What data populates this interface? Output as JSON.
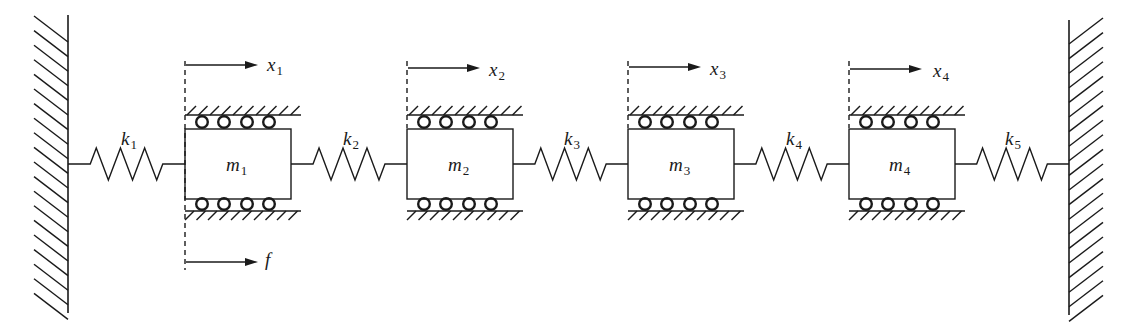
{
  "diagram": {
    "line_color": "#1a1a1a",
    "background": "#ffffff",
    "masses": [
      {
        "label": "m",
        "sub": "1",
        "displacement": "x",
        "disp_sub": "1"
      },
      {
        "label": "m",
        "sub": "2",
        "displacement": "x",
        "disp_sub": "2"
      },
      {
        "label": "m",
        "sub": "3",
        "displacement": "x",
        "disp_sub": "3"
      },
      {
        "label": "m",
        "sub": "4",
        "displacement": "x",
        "disp_sub": "4"
      }
    ],
    "springs": [
      {
        "label": "k",
        "sub": "1"
      },
      {
        "label": "k",
        "sub": "2"
      },
      {
        "label": "k",
        "sub": "3"
      },
      {
        "label": "k",
        "sub": "4"
      },
      {
        "label": "k",
        "sub": "5"
      }
    ],
    "force": {
      "label": "f",
      "applied_to": "m1"
    },
    "rollers_per_side": 4
  }
}
